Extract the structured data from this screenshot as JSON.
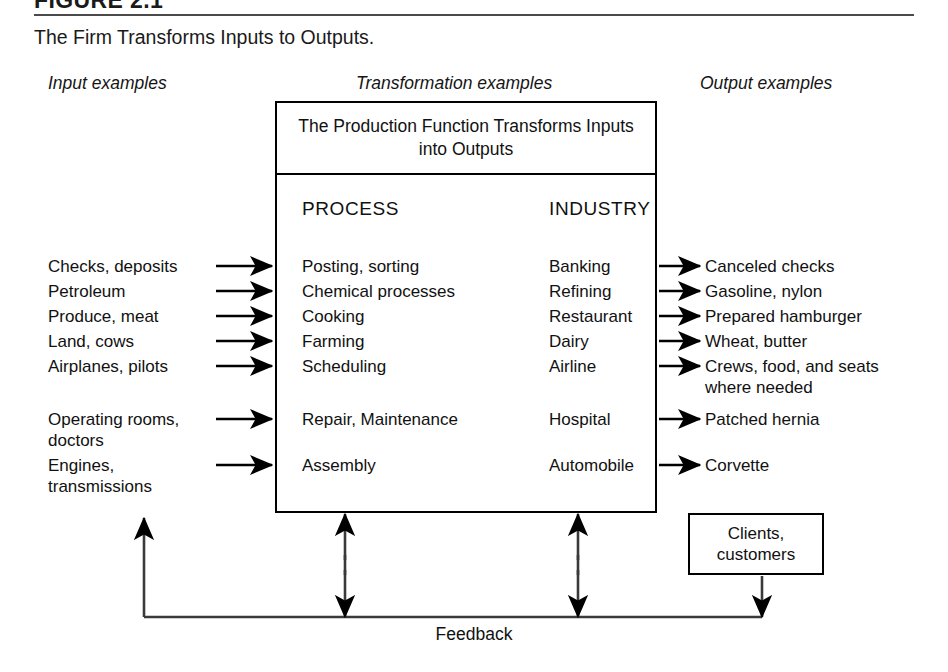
{
  "figure": {
    "number": "FIGURE 2.1",
    "caption": "The Firm Transforms Inputs to Outputs."
  },
  "columns": {
    "input_header": "Input examples",
    "transformation_header": "Transformation examples",
    "output_header": "Output examples"
  },
  "main_box": {
    "header": "The Production Function Transforms\nInputs into Outputs",
    "process_title": "PROCESS",
    "industry_title": "INDUSTRY"
  },
  "rows": {
    "group_a": [
      {
        "input": "Checks, deposits",
        "process": "Posting, sorting",
        "industry": "Banking",
        "output": "Canceled checks"
      },
      {
        "input": "Petroleum",
        "process": "Chemical processes",
        "industry": "Refining",
        "output": "Gasoline, nylon"
      },
      {
        "input": "Produce, meat",
        "process": "Cooking",
        "industry": "Restaurant",
        "output": "Prepared hamburger"
      },
      {
        "input": "Land, cows",
        "process": "Farming",
        "industry": "Dairy",
        "output": "Wheat, butter"
      },
      {
        "input": "Airplanes, pilots",
        "process": "Scheduling",
        "industry": "Airline",
        "output": "Crews, food, and seats\n   where needed"
      }
    ],
    "group_b": [
      {
        "input": "Operating rooms,\n   doctors",
        "process": "Repair, Maintenance",
        "industry": "Hospital",
        "output": "Patched hernia"
      },
      {
        "input": "Engines,\n   transmissions",
        "process": "Assembly",
        "industry": "Automobile",
        "output": "Corvette"
      }
    ]
  },
  "clients_box": {
    "text": "Clients,\ncustomers"
  },
  "feedback": {
    "label": "Feedback"
  },
  "colors": {
    "line": "#000000",
    "rule": "#4a4a4a",
    "text": "#111111",
    "background": "#ffffff"
  }
}
